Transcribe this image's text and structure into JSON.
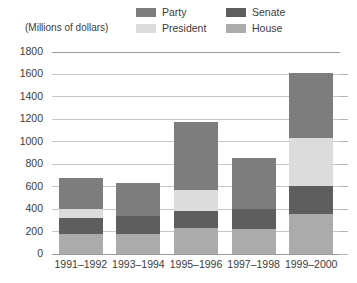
{
  "chart_data": {
    "type": "bar",
    "subtype": "stacked-bar",
    "title": "",
    "subtitle": "",
    "xlabel": "",
    "ylabel": "(Millions of dollars)",
    "categories": [
      "1991–1992",
      "1993–1994",
      "1995–1996",
      "1997–1998",
      "1999–2000"
    ],
    "series": [
      {
        "name": "House",
        "values": [
          180,
          180,
          230,
          225,
          360
        ]
      },
      {
        "name": "Senate",
        "values": [
          140,
          160,
          155,
          175,
          245
        ]
      },
      {
        "name": "President",
        "values": [
          80,
          0,
          185,
          0,
          425
        ]
      },
      {
        "name": "Party",
        "values": [
          280,
          290,
          610,
          455,
          580
        ]
      }
    ],
    "stack_order_bottom_to_top": [
      "House",
      "Senate",
      "President",
      "Party"
    ],
    "totals": [
      680,
      630,
      1180,
      855,
      1610
    ],
    "ylim": [
      0,
      1800
    ],
    "yticks": [
      0,
      200,
      400,
      600,
      800,
      1000,
      1200,
      1400,
      1600,
      1800
    ],
    "ytick_labels": [
      "0",
      "200",
      "400",
      "600",
      "800",
      "1000",
      "1200",
      "1400",
      "1600",
      "1800"
    ],
    "grid": true,
    "legend_position": "top-right",
    "colors": {
      "Party": "#7d7d7d",
      "President": "#dcdcdc",
      "Senate": "#5e5e5e",
      "House": "#ababab"
    }
  },
  "axis_caption": "(Millions of dollars)",
  "legend": {
    "items": [
      {
        "label": "Party",
        "color": "#7d7d7d",
        "swatch_name": "legend-swatch-party"
      },
      {
        "label": "Senate",
        "color": "#5e5e5e",
        "swatch_name": "legend-swatch-senate"
      },
      {
        "label": "President",
        "color": "#dcdcdc",
        "swatch_name": "legend-swatch-president"
      },
      {
        "label": "House",
        "color": "#ababab",
        "swatch_name": "legend-swatch-house"
      }
    ]
  }
}
